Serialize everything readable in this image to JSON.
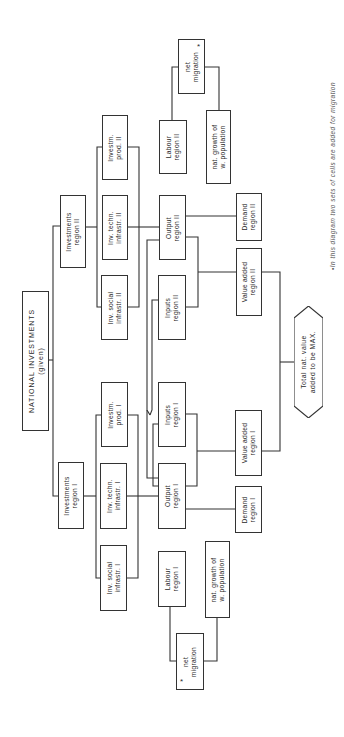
{
  "diagram": {
    "orientation": "rotated -90deg",
    "nodes": {
      "national": {
        "line1": "NATIONAL  INVESTMENTS",
        "line2": "(given)"
      },
      "inv_region_2": {
        "line1": "Investments",
        "line2": "region II"
      },
      "inv_region_1": {
        "line1": "Investments",
        "line2": "region I"
      },
      "inv_social_2": {
        "line1": "Inv. social",
        "line2": "infrastr. II"
      },
      "inv_techn_2": {
        "line1": "Inv. techn.",
        "line2": "infrastr. II"
      },
      "investm_prod_2": {
        "line1": "Investm.",
        "line2": "prod. II"
      },
      "investm_prod_1": {
        "line1": "Investm.",
        "line2": "prod. I"
      },
      "inv_techn_1": {
        "line1": "Inv. techn.",
        "line2": "infrastr. I"
      },
      "inv_social_1": {
        "line1": "Inv. social",
        "line2": "infrastr. I"
      },
      "output_2": {
        "line1": "Output",
        "line2": "region II"
      },
      "inputs_2": {
        "line1": "Inputs",
        "line2": "region II"
      },
      "inputs_1": {
        "line1": "Inputs",
        "line2": "region I"
      },
      "output_1": {
        "line1": "Output",
        "line2": "region I"
      },
      "labour_2": {
        "line1": "Labour",
        "line2": "region II"
      },
      "labour_1": {
        "line1": "Labour",
        "line2": "region I"
      },
      "net_migration_2": {
        "line1": "net",
        "line2": "migration",
        "marker": "*"
      },
      "net_migration_1": {
        "line1": "net",
        "line2": "migration",
        "marker": "*"
      },
      "nat_growth_2": {
        "line1": "nat. growth of",
        "line2": "w. population"
      },
      "nat_growth_1": {
        "line1": "nat. growth of",
        "line2": "w. population"
      },
      "demand_2": {
        "line1": "Demand",
        "line2": "region II"
      },
      "value_added_2": {
        "line1": "Value added",
        "line2": "region II"
      },
      "value_added_1": {
        "line1": "Value added",
        "line2": "region I"
      },
      "demand_1": {
        "line1": "Demand",
        "line2": "region I"
      },
      "total": {
        "line1": "Total nat. value",
        "line2": "added to be MAX."
      }
    },
    "footnote": "•In this diagram two sets of cells are added for migration",
    "colors": {
      "line": "#333333",
      "text": "#2a2a2a",
      "background": "#ffffff"
    }
  }
}
